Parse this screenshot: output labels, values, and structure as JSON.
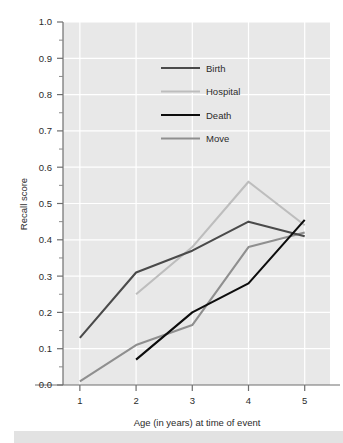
{
  "chart_data": {
    "type": "line",
    "title": "",
    "xlabel": "Age (in years) at time of event",
    "ylabel": "Recall score",
    "x": [
      1,
      2,
      3,
      4,
      5
    ],
    "xlim": [
      0.7,
      5.45
    ],
    "ylim": [
      0.0,
      1.0
    ],
    "xticks": [
      "1",
      "2",
      "3",
      "4",
      "5"
    ],
    "yticks": [
      "0.0",
      "0.1",
      "0.2",
      "0.3",
      "0.4",
      "0.5",
      "0.6",
      "0.7",
      "0.8",
      "0.9",
      "1.0"
    ],
    "minor_ytick_step": 0.05,
    "grid": true,
    "grid_color": "#ffffff",
    "plot_background": "#e8e8e8",
    "legend_position": "upper-center-inside",
    "series": [
      {
        "name": "Birth",
        "color": "#4a4a4a",
        "width": 2.1,
        "x": [
          1,
          2,
          3,
          4,
          5
        ],
        "values": [
          0.13,
          0.31,
          0.37,
          0.45,
          0.41
        ]
      },
      {
        "name": "Hospital",
        "color": "#bdbdbd",
        "width": 2.1,
        "x": [
          2,
          3,
          4,
          5
        ],
        "values": [
          0.25,
          0.38,
          0.56,
          0.44
        ]
      },
      {
        "name": "Death",
        "color": "#0d0d0d",
        "width": 2.1,
        "x": [
          2,
          3,
          4,
          5
        ],
        "values": [
          0.07,
          0.2,
          0.28,
          0.455
        ]
      },
      {
        "name": "Move",
        "color": "#8f8f8f",
        "width": 2.1,
        "x": [
          1,
          2,
          3,
          4,
          5
        ],
        "values": [
          0.01,
          0.11,
          0.165,
          0.38,
          0.42
        ]
      }
    ]
  },
  "legend": {
    "items": [
      {
        "label": "Birth"
      },
      {
        "label": "Hospital"
      },
      {
        "label": "Death"
      },
      {
        "label": "Move"
      }
    ]
  },
  "axes": {
    "y_title": "Recall score",
    "x_title": "Age (in years) at time of event"
  }
}
